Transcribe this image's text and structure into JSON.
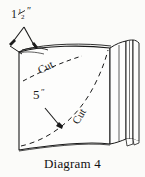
{
  "diagram": {
    "caption": "Diagram 4",
    "title": "Diagram 4",
    "background_color": "#fbfbf9",
    "ink_color": "#1a1a1a",
    "labels": {
      "top_measure_whole": "1",
      "top_measure_fraction_numerator": "1",
      "top_measure_fraction_denominator": "2",
      "top_measure_unit": "″",
      "top_measure_full": "1½″",
      "cut_top": "Cut",
      "cut_bottom": "Cut",
      "side_measure_value": "5",
      "side_measure_unit": "″",
      "side_measure_full": "5″"
    },
    "annotations": {
      "arrow_top_left": "double-headed measurement arrow",
      "arrow_five_inch": "arrow pointing to lower-right cut curve"
    }
  }
}
